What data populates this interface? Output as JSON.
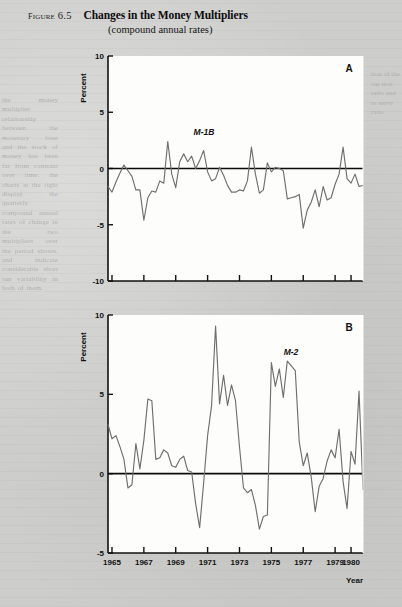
{
  "caption": {
    "figure_number": "Figure 6.5",
    "title": "Changes in the Money Multipliers",
    "subtitle": "(compound annual rates)"
  },
  "axis": {
    "y_title": "Percent",
    "x_title": "Year"
  },
  "chart_data": [
    {
      "type": "line",
      "panel": "A",
      "title": "Changes in the Money Multipliers",
      "series_label": "M-1B",
      "xlabel": "Year",
      "ylabel": "Percent",
      "ylim": [
        -10,
        10
      ],
      "yticks": [
        10,
        5,
        0,
        -5,
        -10
      ],
      "ytick_labels": [
        "10",
        "5",
        "0",
        "-5",
        "-10"
      ],
      "xlim": [
        1964.75,
        1980.75
      ],
      "xticks": [
        1965,
        1967,
        1969,
        1971,
        1973,
        1975,
        1977,
        1979,
        1980
      ],
      "xtick_labels": [
        "1965",
        "1967",
        "1969",
        "1971",
        "1973",
        "1975",
        "1977",
        "1979",
        "1980"
      ],
      "grid": false,
      "legend": "none",
      "x": [
        1964.75,
        1965.0,
        1965.25,
        1965.5,
        1965.75,
        1966.0,
        1966.25,
        1966.5,
        1966.75,
        1967.0,
        1967.25,
        1967.5,
        1967.75,
        1968.0,
        1968.25,
        1968.5,
        1968.75,
        1969.0,
        1969.25,
        1969.5,
        1969.75,
        1970.0,
        1970.25,
        1970.5,
        1970.75,
        1971.0,
        1971.25,
        1971.5,
        1971.75,
        1972.0,
        1972.25,
        1972.5,
        1972.75,
        1973.0,
        1973.25,
        1973.5,
        1973.75,
        1974.0,
        1974.25,
        1974.5,
        1974.75,
        1975.0,
        1975.25,
        1975.5,
        1975.75,
        1976.0,
        1976.25,
        1976.5,
        1976.75,
        1977.0,
        1977.25,
        1977.5,
        1977.75,
        1978.0,
        1978.25,
        1978.5,
        1978.75,
        1979.0,
        1979.25,
        1979.5,
        1979.75,
        1980.0,
        1980.25,
        1980.5,
        1980.75
      ],
      "values": [
        -1.6,
        -2.1,
        -1.2,
        -0.4,
        0.3,
        -0.2,
        -0.7,
        -1.9,
        -1.9,
        -4.6,
        -2.6,
        -2.0,
        -2.1,
        -1.1,
        -1.3,
        2.4,
        -0.5,
        -1.7,
        0.6,
        1.3,
        0.6,
        1.1,
        0.0,
        0.7,
        1.6,
        -0.3,
        -1.1,
        -0.9,
        0.1,
        -0.6,
        -1.5,
        -2.1,
        -2.1,
        -1.9,
        -2.0,
        -1.1,
        1.9,
        -0.5,
        -2.2,
        -1.9,
        0.5,
        -0.3,
        0.1,
        0.0,
        -0.2,
        -2.7,
        -2.6,
        -2.5,
        -2.3,
        -5.3,
        -3.7,
        -3.0,
        -1.9,
        -3.4,
        -1.6,
        -2.8,
        -2.6,
        -1.4,
        -0.5,
        1.9,
        -0.9,
        -1.3,
        -0.5,
        -1.6,
        -1.5
      ]
    },
    {
      "type": "line",
      "panel": "B",
      "title": "Changes in the Money Multipliers",
      "series_label": "M-2",
      "xlabel": "Year",
      "ylabel": "Percent",
      "ylim": [
        -5,
        10
      ],
      "yticks": [
        10,
        5,
        0,
        -5
      ],
      "ytick_labels": [
        "10",
        "5",
        "0",
        "-5"
      ],
      "xlim": [
        1964.75,
        1980.75
      ],
      "xticks": [
        1965,
        1967,
        1969,
        1971,
        1973,
        1975,
        1977,
        1979,
        1980
      ],
      "xtick_labels": [
        "1965",
        "1967",
        "1969",
        "1971",
        "1973",
        "1975",
        "1977",
        "1979",
        "1980"
      ],
      "grid": false,
      "legend": "none",
      "x": [
        1964.75,
        1965.0,
        1965.25,
        1965.5,
        1965.75,
        1966.0,
        1966.25,
        1966.5,
        1966.75,
        1967.0,
        1967.25,
        1967.5,
        1967.75,
        1968.0,
        1968.25,
        1968.5,
        1968.75,
        1969.0,
        1969.25,
        1969.5,
        1969.75,
        1970.0,
        1970.25,
        1970.5,
        1970.75,
        1971.0,
        1971.25,
        1971.5,
        1971.75,
        1972.0,
        1972.25,
        1972.5,
        1972.75,
        1973.0,
        1973.25,
        1973.5,
        1973.75,
        1974.0,
        1974.25,
        1974.5,
        1974.75,
        1975.0,
        1975.25,
        1975.5,
        1975.75,
        1976.0,
        1976.25,
        1976.5,
        1976.75,
        1977.0,
        1977.25,
        1977.5,
        1977.75,
        1978.0,
        1978.25,
        1978.5,
        1978.75,
        1979.0,
        1979.25,
        1979.5,
        1979.75,
        1980.0,
        1980.25,
        1980.5,
        1980.75
      ],
      "values": [
        3.1,
        2.2,
        2.4,
        1.7,
        0.9,
        -0.9,
        -0.7,
        1.9,
        0.3,
        2.1,
        4.7,
        4.6,
        0.9,
        1.0,
        1.5,
        1.3,
        0.5,
        0.4,
        0.9,
        1.1,
        0.2,
        0.1,
        -1.9,
        -3.4,
        -0.6,
        2.4,
        4.3,
        9.3,
        4.4,
        6.2,
        4.3,
        5.6,
        4.6,
        1.7,
        -0.9,
        -1.2,
        -1.0,
        -2.0,
        -3.5,
        -2.7,
        -2.6,
        7.0,
        5.5,
        6.6,
        4.8,
        7.1,
        6.8,
        6.5,
        2.0,
        0.5,
        1.3,
        -0.2,
        -2.4,
        -0.8,
        -0.3,
        0.8,
        1.5,
        1.0,
        2.8,
        -0.5,
        -2.2,
        1.4,
        0.6,
        5.2,
        -1.0
      ]
    }
  ],
  "ghost": {
    "left_column": "the money multiplier relationship between the monetary base and the stock of money has been far from constant over time. the charts at the right display the quarterly compound annual rates of change in the two multipliers over the period shown, and indicate considerable short run variability in both of them.",
    "right_column": "tion of the cur tion ratio and re serve ratio"
  }
}
